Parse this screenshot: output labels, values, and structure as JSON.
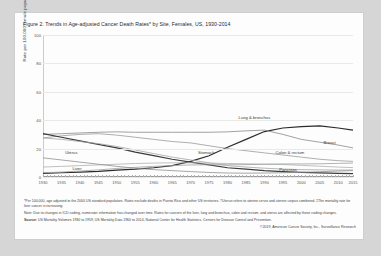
{
  "figure": {
    "title": "Figure 2. Trends in Age-adjusted Cancer Death Rates* by Site, Females, US, 1930-2014",
    "ylabel": "Rate per 100,000 female population",
    "footnote1": "*Per 100,000, age adjusted to the 2000 US standard population. Rates exclude deaths in Puerto Rico and other US territories. †Uterus refers to uterine cervix and uterine corpus combined. ‡The mortality rate for liver cancer is increasing.",
    "footnote2": "Note: Due to changes in ICD coding, numerator information has changed over time. Rates for cancers of the liver, lung and bronchus, colon and rectum, and uterus are affected by these coding changes.",
    "source_label": "Source:",
    "source_text": "US Mortality Volumes 1930 to 1959, US Mortality Data 1960 to 2014, National Center for Health Statistics, Centers for Disease Control and Prevention.",
    "copyright": "©2019, American Cancer Society, Inc., Surveillance Research"
  },
  "chart_data": {
    "type": "line",
    "title": "Figure 2. Trends in Age-adjusted Cancer Death Rates* by Site, Females, US, 1930-2014",
    "xlabel": "",
    "ylabel": "Rate per 100,000 female population",
    "xlim": [
      1930,
      2014
    ],
    "ylim": [
      0,
      100
    ],
    "yticks": [
      0,
      20,
      40,
      60,
      80,
      100
    ],
    "xticks": [
      1930,
      1935,
      1940,
      1945,
      1950,
      1955,
      1960,
      1965,
      1970,
      1975,
      1980,
      1985,
      1990,
      1995,
      2000,
      2005,
      2010,
      2015
    ],
    "grid": true,
    "legend": "inline-labels",
    "x": [
      1930,
      1935,
      1940,
      1945,
      1950,
      1955,
      1960,
      1965,
      1970,
      1975,
      1980,
      1985,
      1990,
      1995,
      2000,
      2005,
      2010,
      2014
    ],
    "series": [
      {
        "name": "Lung & bronchus",
        "color": "#2b2b2b",
        "values": [
          2.5,
          3.0,
          3.5,
          4.0,
          4.8,
          5.5,
          6.5,
          8.0,
          11.0,
          15.0,
          21.0,
          26.5,
          32.0,
          34.5,
          35.5,
          36.0,
          34.5,
          33.0
        ]
      },
      {
        "name": "Breast",
        "color": "#8a8a8a",
        "values": [
          30.0,
          30.5,
          31.0,
          31.5,
          31.8,
          31.5,
          31.5,
          31.5,
          31.5,
          31.5,
          31.8,
          32.5,
          33.0,
          30.0,
          26.5,
          24.5,
          22.5,
          20.5
        ]
      },
      {
        "name": "Colon & rectum",
        "color": "#9a9a9a",
        "values": [
          27.5,
          29.0,
          30.0,
          30.5,
          29.5,
          28.0,
          26.5,
          25.0,
          24.0,
          22.0,
          20.0,
          18.5,
          17.0,
          15.5,
          14.0,
          12.5,
          11.5,
          11.0
        ]
      },
      {
        "name": "Stomach",
        "color": "#3a3a3a",
        "values": [
          30.5,
          28.0,
          25.5,
          23.0,
          20.5,
          17.5,
          15.0,
          12.5,
          10.5,
          8.5,
          6.5,
          5.5,
          4.5,
          3.8,
          3.3,
          2.9,
          2.6,
          2.4
        ]
      },
      {
        "name": "Uterus†",
        "color": "#a5a5a5",
        "values": [
          27.5,
          26.5,
          25.0,
          23.5,
          21.5,
          19.0,
          16.5,
          14.0,
          12.0,
          10.0,
          8.0,
          7.0,
          6.2,
          5.6,
          5.2,
          5.0,
          4.9,
          4.9
        ]
      },
      {
        "name": "Ovary",
        "color": "#b0b0b0",
        "values": [
          7.0,
          7.5,
          8.0,
          8.5,
          9.0,
          9.5,
          9.8,
          10.0,
          10.0,
          9.8,
          9.5,
          9.3,
          9.0,
          8.8,
          8.2,
          7.6,
          7.0,
          6.6
        ]
      },
      {
        "name": "Pancreas",
        "color": "#9f9f9f",
        "values": [
          3.0,
          3.5,
          4.2,
          5.0,
          6.0,
          6.8,
          7.5,
          8.0,
          8.5,
          8.6,
          8.6,
          8.7,
          9.0,
          9.2,
          9.2,
          9.3,
          9.6,
          9.8
        ]
      },
      {
        "name": "Liver‡",
        "color": "#8f8f8f",
        "values": [
          13.5,
          12.0,
          10.5,
          9.0,
          7.5,
          6.2,
          5.2,
          4.5,
          3.8,
          3.2,
          2.8,
          2.7,
          2.8,
          3.0,
          3.3,
          3.7,
          4.2,
          4.5
        ]
      }
    ],
    "point_labels": [
      {
        "text": "Lung & bronchus",
        "x": 1983,
        "y": 44
      },
      {
        "text": "Breast",
        "x": 2006,
        "y": 26
      },
      {
        "text": "Colon & rectum",
        "x": 1993,
        "y": 19
      },
      {
        "text": "Pancreas",
        "x": 1994,
        "y": 7
      },
      {
        "text": "Uterus",
        "x": 1936,
        "y": 19
      },
      {
        "text": "Stomach",
        "x": 1972,
        "y": 19
      },
      {
        "text": "Liver",
        "x": 1938,
        "y": 8
      }
    ]
  }
}
